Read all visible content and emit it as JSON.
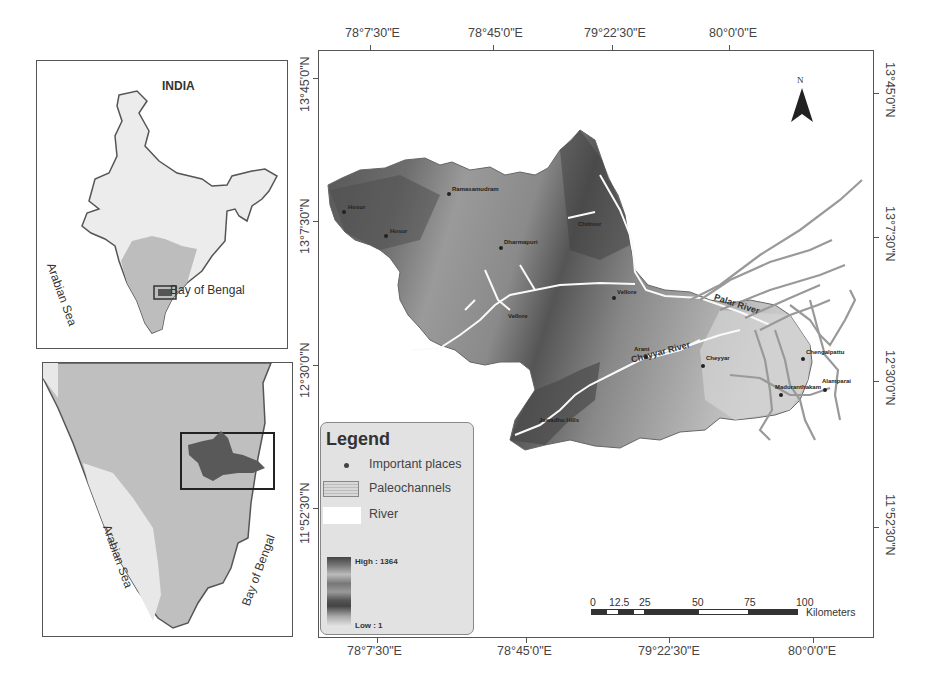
{
  "india_inset": {
    "title": "INDIA",
    "labels": {
      "west_sea": "Arabian Sea",
      "east_sea": "Bay of Bengal"
    }
  },
  "tn_inset": {
    "labels": {
      "west_sea": "Arabian Sea",
      "east_sea": "Bay of Bengal"
    }
  },
  "main_map": {
    "longitude_ticks": [
      "78°7'30\"E",
      "78°45'0\"E",
      "79°22'30\"E",
      "80°0'0\"E"
    ],
    "latitude_ticks": [
      "13°45'0\"N",
      "13°7'30\"N",
      "12°30'0\"N",
      "11°52'30\"N"
    ],
    "north_arrow": {
      "label": "N"
    },
    "rivers": [
      {
        "name": "Palar River"
      },
      {
        "name": "Cheyyar River"
      }
    ],
    "places": [
      {
        "name": "Ramasamudram"
      },
      {
        "name": "Hosur"
      },
      {
        "name": "Hosur"
      },
      {
        "name": "Dharmapuri"
      },
      {
        "name": "Chittoor"
      },
      {
        "name": "Vellore"
      },
      {
        "name": "Vellore"
      },
      {
        "name": "Arani"
      },
      {
        "name": "Cheyyar"
      },
      {
        "name": "Jawadhu Hills"
      },
      {
        "name": "Chengalpattu"
      },
      {
        "name": "Maduranthakam"
      },
      {
        "name": "Alamparai"
      }
    ]
  },
  "legend": {
    "title": "Legend",
    "items": [
      {
        "label": "Important places",
        "symbol": "dot"
      },
      {
        "label": "Paleochannels",
        "symbol": "hatched-box"
      },
      {
        "label": "River",
        "symbol": "white-box"
      }
    ],
    "elevation": {
      "high_label": "High : 1364",
      "low_label": "Low : 1"
    }
  },
  "scale_bar": {
    "ticks": [
      "0",
      "12.5",
      "25",
      "50",
      "75",
      "100"
    ],
    "unit": "Kilometers"
  }
}
